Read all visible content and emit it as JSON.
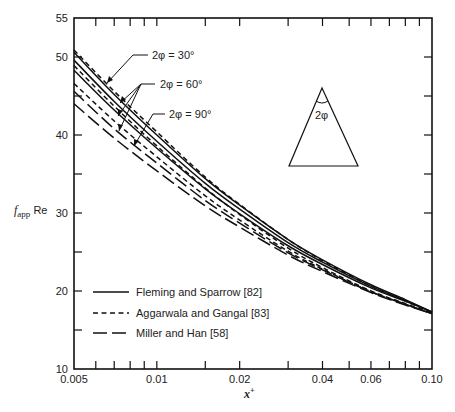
{
  "chart_data": {
    "type": "line",
    "title": "",
    "xlabel": "x+",
    "ylabel": "f_app Re",
    "xscale": "log",
    "xlim": [
      0.005,
      0.1
    ],
    "ylim": [
      10,
      55
    ],
    "grid": false,
    "x_ticks": [
      {
        "value": 0.005,
        "label": "0.005"
      },
      {
        "value": 0.01,
        "label": "0.01"
      },
      {
        "value": 0.02,
        "label": "0.02"
      },
      {
        "value": 0.04,
        "label": "0.04"
      },
      {
        "value": 0.06,
        "label": "0.06"
      },
      {
        "value": 0.1,
        "label": "0.10"
      }
    ],
    "x_minor_ticks": [
      0.006,
      0.007,
      0.008,
      0.009,
      0.015,
      0.03,
      0.05,
      0.07,
      0.08,
      0.09
    ],
    "y_ticks": [
      {
        "value": 10,
        "label": "10"
      },
      {
        "value": 15,
        "label": ""
      },
      {
        "value": 20,
        "label": "20"
      },
      {
        "value": 25,
        "label": ""
      },
      {
        "value": 30,
        "label": "30"
      },
      {
        "value": 35,
        "label": ""
      },
      {
        "value": 40,
        "label": "40"
      },
      {
        "value": 45,
        "label": ""
      },
      {
        "value": 50,
        "label": "50"
      },
      {
        "value": 55,
        "label": "55"
      }
    ],
    "x": [
      0.005,
      0.007,
      0.01,
      0.015,
      0.02,
      0.03,
      0.04,
      0.06,
      0.08,
      0.1
    ],
    "series": [
      {
        "name": "Fleming and Sparrow [82], 2φ = 30°",
        "style": "solid",
        "values": [
          50.6,
          45.2,
          40.0,
          34.4,
          31.0,
          26.6,
          24.0,
          20.8,
          18.9,
          17.3
        ]
      },
      {
        "name": "Fleming and Sparrow [82], 2φ = 60°",
        "style": "solid",
        "values": [
          49.6,
          44.3,
          39.2,
          33.8,
          30.5,
          26.2,
          23.7,
          20.6,
          18.8,
          17.3
        ]
      },
      {
        "name": "Fleming and Sparrow [82], 2φ = 90°",
        "style": "solid",
        "values": [
          48.3,
          43.2,
          38.3,
          33.1,
          29.9,
          25.8,
          23.4,
          20.4,
          18.7,
          17.3
        ]
      },
      {
        "name": "Aggarwala and Gangal [83], 2φ = 30°",
        "style": "dashed",
        "values": [
          50.9,
          45.6,
          40.4,
          34.6,
          31.1,
          26.6,
          23.9,
          20.6,
          18.7,
          17.2
        ]
      },
      {
        "name": "Aggarwala and Gangal [83], 2φ = 60°",
        "style": "dashed",
        "values": [
          48.9,
          43.7,
          38.6,
          33.2,
          29.8,
          25.5,
          23.0,
          20.0,
          18.4,
          17.1
        ]
      },
      {
        "name": "Aggarwala and Gangal [83], 2φ = 90°",
        "style": "dashed",
        "values": [
          46.6,
          41.8,
          37.2,
          32.2,
          29.1,
          25.1,
          22.8,
          19.9,
          18.3,
          17.1
        ]
      },
      {
        "name": "Miller and Han [58], 2φ = 60°",
        "style": "longdash",
        "values": [
          45.6,
          40.8,
          36.4,
          31.6,
          28.7,
          24.9,
          22.7,
          19.9,
          18.3,
          17.1
        ]
      },
      {
        "name": "Miller and Han [58], 2φ = 90°",
        "style": "longdash",
        "values": [
          44.0,
          39.6,
          35.4,
          30.9,
          28.2,
          24.6,
          22.5,
          19.8,
          18.2,
          17.1
        ]
      }
    ],
    "legend": {
      "position": "lower left",
      "entries": [
        {
          "label": "Fleming and Sparrow [82]",
          "style": "solid"
        },
        {
          "label": "Aggarwala and Gangal [83]",
          "style": "dashed"
        },
        {
          "label": "Miller and Han [58]",
          "style": "longdash"
        }
      ]
    },
    "annotations": [
      {
        "text": "2φ = 30°",
        "x": 0.011,
        "y": 50
      },
      {
        "text": "2φ = 60°",
        "x": 0.015,
        "y": 46.5
      },
      {
        "text": "2φ = 90°",
        "x": 0.017,
        "y": 42.5
      }
    ],
    "inset": {
      "shape": "isosceles-triangle",
      "apex_label": "2φ"
    }
  },
  "labels": {
    "ylabel_main": "f",
    "ylabel_sub": "app",
    "ylabel_suffix": " Re",
    "xlabel_main": "x",
    "xlabel_sup": "+",
    "anno_30": "2φ = 30°",
    "anno_60": "2φ = 60°",
    "anno_90": "2φ = 90°",
    "inset_label": "2φ",
    "legend_0": "Fleming and Sparrow [82]",
    "legend_1": "Aggarwala and Gangal [83]",
    "legend_2": "Miller and Han [58]"
  }
}
